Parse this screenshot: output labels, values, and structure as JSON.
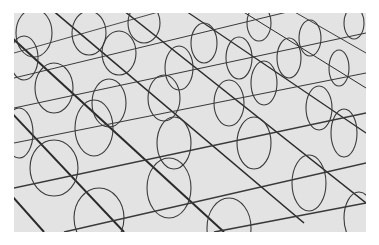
{
  "image": {
    "description": "Perspective rendering of a grid plane with vertical ellipse loops at each grid intersection",
    "background_color": "#e3e3e3",
    "line_color": "#222222"
  }
}
